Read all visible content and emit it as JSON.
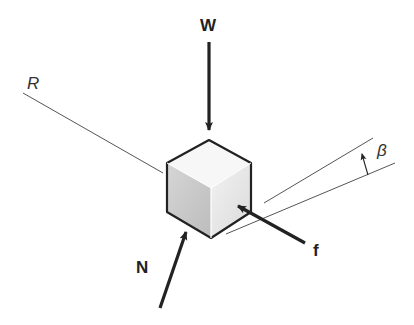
{
  "diagram": {
    "labels": {
      "weight": "W",
      "normal": "N",
      "friction": "f",
      "resultant_line": "R",
      "angle": "β"
    },
    "colors": {
      "stroke": "#222222",
      "thin_line": "#555555",
      "face_left": "#c8c8c8",
      "face_right": "#e6e6e6",
      "face_top": "#f6f6f6"
    }
  }
}
